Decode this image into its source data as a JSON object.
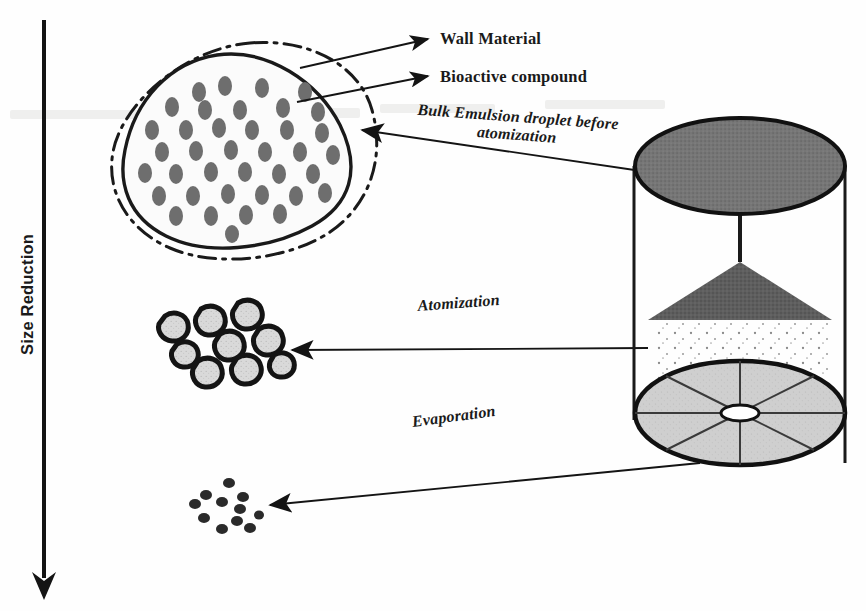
{
  "figure": {
    "background_color": "#fefefe",
    "ink_color": "#1a1a1a"
  },
  "axis": {
    "vertical_label": "Size Reduction",
    "arrow_direction": "down",
    "arrow_name": "size-reduction-arrow"
  },
  "labels": {
    "wall_material": "Wall Material",
    "bioactive_compound": "Bioactive compound",
    "bulk_emulsion": "Bulk Emulsion  droplet before atomization",
    "bulk_emulsion_line1": "Bulk Emulsion  droplet before",
    "bulk_emulsion_line2": "atomization",
    "atomization": "Atomization",
    "evaporation": "Evaporation"
  },
  "stages": [
    {
      "name": "bulk-emulsion-droplet",
      "stage_label": "Bulk Emulsion  droplet before atomization",
      "description": "Large blob with dash-dot wall material boundary and gray bioactive compound inclusions",
      "inclusion_count": 38,
      "inclusion_color": "#6e6e6e",
      "fill_color": "#fbfbfb",
      "outline_color": "#1a1a1a"
    },
    {
      "name": "atomized-droplets",
      "stage_label": "Atomization",
      "description": "Cluster of nine small droplets with thick outlines and speckled interiors",
      "droplet_count": 9,
      "fill_color": "#dcdcdc",
      "outline_color": "#141414"
    },
    {
      "name": "dried-particles",
      "stage_label": "Evaporation",
      "description": "Cluster of eleven tiny solid dark dried powder particles",
      "particle_count": 11,
      "fill_color": "#2a2a2a"
    }
  ],
  "spray_dryer": {
    "name": "spray-dryer-chamber",
    "top_disc_color": "#767676",
    "base_disc_color": "#cfcfcf",
    "cone_color": "#5e5e5e",
    "wall_color": "#1a1a1a",
    "base_sector_count": 8,
    "spray_dot_count": 96
  },
  "arrows": [
    {
      "name": "arrow-to-wall-material",
      "points_to": "Wall Material",
      "direction": "right"
    },
    {
      "name": "arrow-to-bioactive-compound",
      "points_to": "Bioactive compound",
      "direction": "right"
    },
    {
      "name": "arrow-bulk-emulsion",
      "points_to": "bulk-emulsion-droplet",
      "direction": "left"
    },
    {
      "name": "arrow-atomization",
      "points_to": "atomized-droplets",
      "direction": "left"
    },
    {
      "name": "arrow-evaporation",
      "points_to": "dried-particles",
      "direction": "left"
    }
  ]
}
